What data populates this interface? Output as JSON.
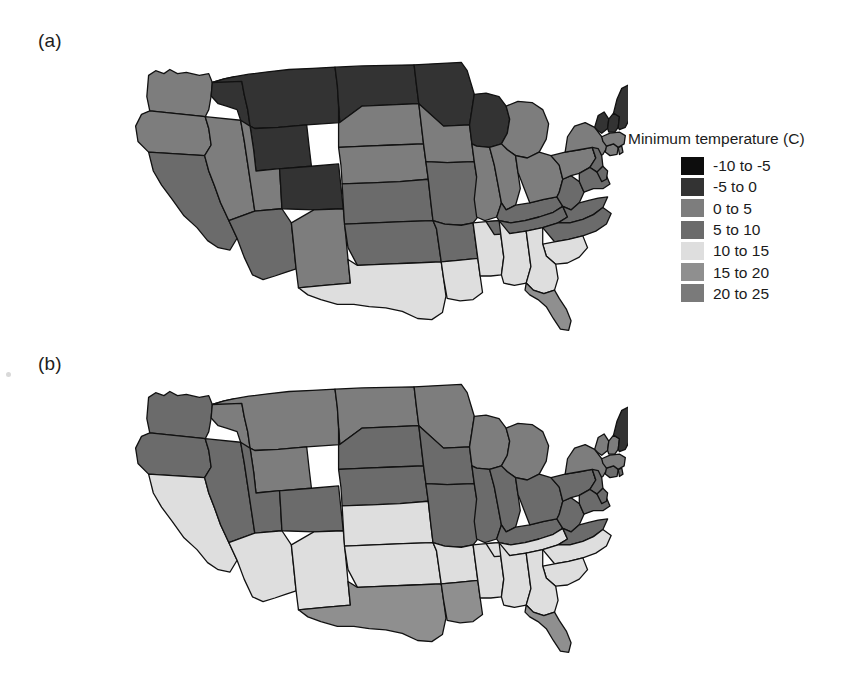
{
  "figure": {
    "background": "#ffffff",
    "panels": [
      {
        "id": "a",
        "label": "(a)",
        "legend": {
          "title": "Minimum temperature (C)",
          "items": [
            {
              "label": "-10 to -5",
              "color": "#0d0d0d"
            },
            {
              "label": "-5 to 0",
              "color": "#333333"
            },
            {
              "label": "0 to 5",
              "color": "#7d7d7d"
            },
            {
              "label": "5 to 10",
              "color": "#6b6b6b"
            },
            {
              "label": "10 to 15",
              "color": "#dedede"
            },
            {
              "label": "15 to 20",
              "color": "#8f8f8f"
            },
            {
              "label": "20 to 25",
              "color": "#7a7a7a"
            }
          ]
        }
      },
      {
        "id": "b",
        "label": "(b)",
        "legend": {
          "title": "Maximum temperature (C)",
          "items": [
            {
              "label": "0 to 5",
              "color": "#0d0d0d"
            },
            {
              "label": "5 to 10",
              "color": "#333333"
            },
            {
              "label": "10 to 15",
              "color": "#7d7d7d"
            },
            {
              "label": "15 to 20",
              "color": "#6b6b6b"
            },
            {
              "label": "20 to 25",
              "color": "#dedede"
            },
            {
              "label": "25 to 30",
              "color": "#8f8f8f"
            },
            {
              "label": "30 to 35",
              "color": "#7a7a7a"
            }
          ]
        }
      }
    ]
  },
  "chart_data": {
    "type": "heatmap",
    "subtitle": "",
    "xlabel": "",
    "ylabel": "",
    "grid": false,
    "legend_position": "right",
    "maps": [
      {
        "panel": "a",
        "variable": "Minimum temperature",
        "units": "C",
        "bins": [
          "-10 to -5",
          "-5 to 0",
          "0 to 5",
          "5 to 10",
          "10 to 15",
          "15 to 20",
          "20 to 25"
        ],
        "bin_colors": [
          "#0d0d0d",
          "#333333",
          "#7d7d7d",
          "#6b6b6b",
          "#dedede",
          "#8f8f8f",
          "#7a7a7a"
        ],
        "bin_midpoints": [
          -7.5,
          -2.5,
          2.5,
          7.5,
          12.5,
          17.5,
          22.5
        ],
        "state_values": [
          {
            "state": "WA",
            "abbr": "WA",
            "bin": "0 to 5",
            "value": 3
          },
          {
            "state": "OR",
            "abbr": "OR",
            "bin": "0 to 5",
            "value": 3
          },
          {
            "state": "CA",
            "abbr": "CA",
            "bin": "5 to 10",
            "value": 7
          },
          {
            "state": "NV",
            "abbr": "NV",
            "bin": "0 to 5",
            "value": 3
          },
          {
            "state": "ID",
            "abbr": "ID",
            "bin": "-5 to 0",
            "value": -2
          },
          {
            "state": "MT",
            "abbr": "MT",
            "bin": "-5 to 0",
            "value": -3
          },
          {
            "state": "WY",
            "abbr": "WY",
            "bin": "-5 to 0",
            "value": -4
          },
          {
            "state": "UT",
            "abbr": "UT",
            "bin": "0 to 5",
            "value": 2
          },
          {
            "state": "CO",
            "abbr": "CO",
            "bin": "-5 to 0",
            "value": -1
          },
          {
            "state": "AZ",
            "abbr": "AZ",
            "bin": "5 to 10",
            "value": 8
          },
          {
            "state": "NM",
            "abbr": "NM",
            "bin": "0 to 5",
            "value": 3
          },
          {
            "state": "ND",
            "abbr": "ND",
            "bin": "-5 to 0",
            "value": -4
          },
          {
            "state": "SD",
            "abbr": "SD",
            "bin": "0 to 5",
            "value": 1
          },
          {
            "state": "NE",
            "abbr": "NE",
            "bin": "0 to 5",
            "value": 3
          },
          {
            "state": "KS",
            "abbr": "KS",
            "bin": "5 to 10",
            "value": 6
          },
          {
            "state": "OK",
            "abbr": "OK",
            "bin": "5 to 10",
            "value": 9
          },
          {
            "state": "TX",
            "abbr": "TX",
            "bin": "10 to 15",
            "value": 13
          },
          {
            "state": "MN",
            "abbr": "MN",
            "bin": "-5 to 0",
            "value": -3
          },
          {
            "state": "IA",
            "abbr": "IA",
            "bin": "0 to 5",
            "value": 3
          },
          {
            "state": "MO",
            "abbr": "MO",
            "bin": "5 to 10",
            "value": 7
          },
          {
            "state": "AR",
            "abbr": "AR",
            "bin": "5 to 10",
            "value": 9
          },
          {
            "state": "LA",
            "abbr": "LA",
            "bin": "10 to 15",
            "value": 14
          },
          {
            "state": "WI",
            "abbr": "WI",
            "bin": "-5 to 0",
            "value": -2
          },
          {
            "state": "IL",
            "abbr": "IL",
            "bin": "0 to 5",
            "value": 5
          },
          {
            "state": "MS",
            "abbr": "MS",
            "bin": "10 to 15",
            "value": 12
          },
          {
            "state": "MI",
            "abbr": "MI",
            "bin": "0 to 5",
            "value": 1
          },
          {
            "state": "IN",
            "abbr": "IN",
            "bin": "0 to 5",
            "value": 5
          },
          {
            "state": "KY",
            "abbr": "KY",
            "bin": "5 to 10",
            "value": 7
          },
          {
            "state": "TN",
            "abbr": "TN",
            "bin": "5 to 10",
            "value": 9
          },
          {
            "state": "AL",
            "abbr": "AL",
            "bin": "10 to 15",
            "value": 12
          },
          {
            "state": "OH",
            "abbr": "OH",
            "bin": "0 to 5",
            "value": 4
          },
          {
            "state": "WV",
            "abbr": "WV",
            "bin": "5 to 10",
            "value": 6
          },
          {
            "state": "VA",
            "abbr": "VA",
            "bin": "5 to 10",
            "value": 7
          },
          {
            "state": "NC",
            "abbr": "NC",
            "bin": "5 to 10",
            "value": 9
          },
          {
            "state": "SC",
            "abbr": "SC",
            "bin": "10 to 15",
            "value": 11
          },
          {
            "state": "GA",
            "abbr": "GA",
            "bin": "10 to 15",
            "value": 11
          },
          {
            "state": "FL",
            "abbr": "FL",
            "bin": "15 to 20",
            "value": 17
          },
          {
            "state": "PA",
            "abbr": "PA",
            "bin": "0 to 5",
            "value": 4
          },
          {
            "state": "NY",
            "abbr": "NY",
            "bin": "0 to 5",
            "value": 2
          },
          {
            "state": "NJ",
            "abbr": "NJ",
            "bin": "5 to 10",
            "value": 6
          },
          {
            "state": "MD",
            "abbr": "MD",
            "bin": "5 to 10",
            "value": 7
          },
          {
            "state": "DE",
            "abbr": "DE",
            "bin": "5 to 10",
            "value": 7
          },
          {
            "state": "CT",
            "abbr": "CT",
            "bin": "0 to 5",
            "value": 4
          },
          {
            "state": "RI",
            "abbr": "RI",
            "bin": "0 to 5",
            "value": 4
          },
          {
            "state": "MA",
            "abbr": "MA",
            "bin": "0 to 5",
            "value": 3
          },
          {
            "state": "VT",
            "abbr": "VT",
            "bin": "-5 to 0",
            "value": -1
          },
          {
            "state": "NH",
            "abbr": "NH",
            "bin": "-5 to 0",
            "value": -1
          },
          {
            "state": "ME",
            "abbr": "ME",
            "bin": "-5 to 0",
            "value": -2
          }
        ]
      },
      {
        "panel": "b",
        "variable": "Maximum temperature",
        "units": "C",
        "bins": [
          "0 to 5",
          "5 to 10",
          "10 to 15",
          "15 to 20",
          "20 to 25",
          "25 to 30",
          "30 to 35"
        ],
        "bin_colors": [
          "#0d0d0d",
          "#333333",
          "#7d7d7d",
          "#6b6b6b",
          "#dedede",
          "#8f8f8f",
          "#7a7a7a"
        ],
        "bin_midpoints": [
          2.5,
          7.5,
          12.5,
          17.5,
          22.5,
          27.5,
          32.5
        ],
        "state_values": [
          {
            "state": "WA",
            "abbr": "WA",
            "bin": "15 to 20",
            "value": 16
          },
          {
            "state": "OR",
            "abbr": "OR",
            "bin": "15 to 20",
            "value": 17
          },
          {
            "state": "CA",
            "abbr": "CA",
            "bin": "20 to 25",
            "value": 23
          },
          {
            "state": "NV",
            "abbr": "NV",
            "bin": "15 to 20",
            "value": 19
          },
          {
            "state": "ID",
            "abbr": "ID",
            "bin": "10 to 15",
            "value": 14
          },
          {
            "state": "MT",
            "abbr": "MT",
            "bin": "10 to 15",
            "value": 13
          },
          {
            "state": "WY",
            "abbr": "WY",
            "bin": "10 to 15",
            "value": 13
          },
          {
            "state": "UT",
            "abbr": "UT",
            "bin": "15 to 20",
            "value": 17
          },
          {
            "state": "CO",
            "abbr": "CO",
            "bin": "15 to 20",
            "value": 16
          },
          {
            "state": "AZ",
            "abbr": "AZ",
            "bin": "20 to 25",
            "value": 24
          },
          {
            "state": "NM",
            "abbr": "NM",
            "bin": "20 to 25",
            "value": 21
          },
          {
            "state": "ND",
            "abbr": "ND",
            "bin": "10 to 15",
            "value": 11
          },
          {
            "state": "SD",
            "abbr": "SD",
            "bin": "15 to 20",
            "value": 15
          },
          {
            "state": "NE",
            "abbr": "NE",
            "bin": "15 to 20",
            "value": 17
          },
          {
            "state": "KS",
            "abbr": "KS",
            "bin": "20 to 25",
            "value": 20
          },
          {
            "state": "OK",
            "abbr": "OK",
            "bin": "20 to 25",
            "value": 22
          },
          {
            "state": "TX",
            "abbr": "TX",
            "bin": "25 to 30",
            "value": 26
          },
          {
            "state": "MN",
            "abbr": "MN",
            "bin": "10 to 15",
            "value": 11
          },
          {
            "state": "IA",
            "abbr": "IA",
            "bin": "15 to 20",
            "value": 15
          },
          {
            "state": "MO",
            "abbr": "MO",
            "bin": "15 to 20",
            "value": 18
          },
          {
            "state": "AR",
            "abbr": "AR",
            "bin": "20 to 25",
            "value": 21
          },
          {
            "state": "LA",
            "abbr": "LA",
            "bin": "25 to 30",
            "value": 25
          },
          {
            "state": "WI",
            "abbr": "WI",
            "bin": "10 to 15",
            "value": 12
          },
          {
            "state": "IL",
            "abbr": "IL",
            "bin": "15 to 20",
            "value": 16
          },
          {
            "state": "MS",
            "abbr": "MS",
            "bin": "20 to 25",
            "value": 24
          },
          {
            "state": "MI",
            "abbr": "MI",
            "bin": "10 to 15",
            "value": 13
          },
          {
            "state": "IN",
            "abbr": "IN",
            "bin": "15 to 20",
            "value": 16
          },
          {
            "state": "KY",
            "abbr": "KY",
            "bin": "15 to 20",
            "value": 18
          },
          {
            "state": "TN",
            "abbr": "TN",
            "bin": "20 to 25",
            "value": 20
          },
          {
            "state": "AL",
            "abbr": "AL",
            "bin": "20 to 25",
            "value": 24
          },
          {
            "state": "OH",
            "abbr": "OH",
            "bin": "15 to 20",
            "value": 15
          },
          {
            "state": "WV",
            "abbr": "WV",
            "bin": "15 to 20",
            "value": 16
          },
          {
            "state": "VA",
            "abbr": "VA",
            "bin": "15 to 20",
            "value": 18
          },
          {
            "state": "NC",
            "abbr": "NC",
            "bin": "20 to 25",
            "value": 20
          },
          {
            "state": "SC",
            "abbr": "SC",
            "bin": "20 to 25",
            "value": 23
          },
          {
            "state": "GA",
            "abbr": "GA",
            "bin": "20 to 25",
            "value": 23
          },
          {
            "state": "FL",
            "abbr": "FL",
            "bin": "25 to 30",
            "value": 28
          },
          {
            "state": "PA",
            "abbr": "PA",
            "bin": "15 to 20",
            "value": 15
          },
          {
            "state": "NY",
            "abbr": "NY",
            "bin": "10 to 15",
            "value": 14
          },
          {
            "state": "NJ",
            "abbr": "NJ",
            "bin": "15 to 20",
            "value": 17
          },
          {
            "state": "MD",
            "abbr": "MD",
            "bin": "15 to 20",
            "value": 18
          },
          {
            "state": "DE",
            "abbr": "DE",
            "bin": "15 to 20",
            "value": 18
          },
          {
            "state": "CT",
            "abbr": "CT",
            "bin": "15 to 20",
            "value": 15
          },
          {
            "state": "RI",
            "abbr": "RI",
            "bin": "15 to 20",
            "value": 15
          },
          {
            "state": "MA",
            "abbr": "MA",
            "bin": "10 to 15",
            "value": 14
          },
          {
            "state": "VT",
            "abbr": "VT",
            "bin": "10 to 15",
            "value": 12
          },
          {
            "state": "NH",
            "abbr": "NH",
            "bin": "10 to 15",
            "value": 13
          },
          {
            "state": "ME",
            "abbr": "ME",
            "bin": "5 to 10",
            "value": 10
          }
        ]
      }
    ]
  }
}
